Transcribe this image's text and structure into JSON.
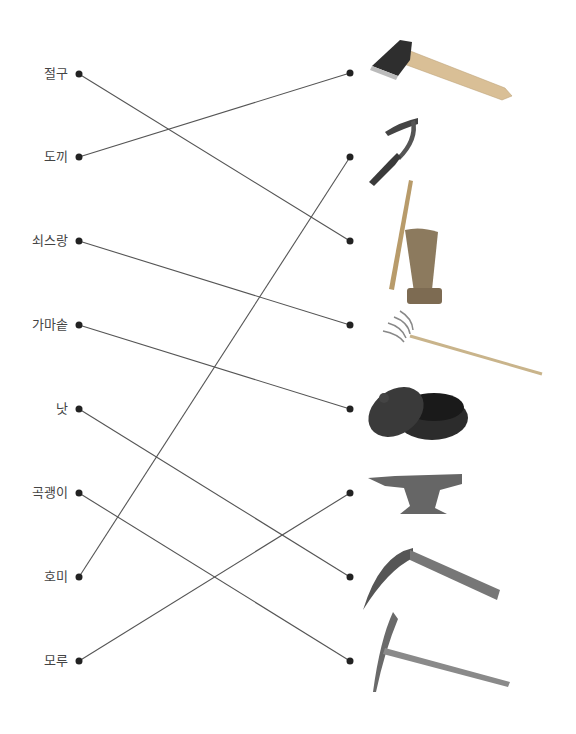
{
  "left_items": [
    {
      "label": "절구",
      "y": 74
    },
    {
      "label": "도끼",
      "y": 157
    },
    {
      "label": "쇠스랑",
      "y": 241
    },
    {
      "label": "가마솥",
      "y": 325
    },
    {
      "label": "낫",
      "y": 409
    },
    {
      "label": "곡괭이",
      "y": 493
    },
    {
      "label": "호미",
      "y": 577
    },
    {
      "label": "모루",
      "y": 661
    }
  ],
  "right_items": [
    {
      "image": "axe",
      "y": 73
    },
    {
      "image": "hoe",
      "y": 157
    },
    {
      "image": "mortar-and-pestle",
      "y": 241
    },
    {
      "image": "pitchfork",
      "y": 325
    },
    {
      "image": "iron-pot",
      "y": 409
    },
    {
      "image": "anvil",
      "y": 493
    },
    {
      "image": "sickle",
      "y": 577
    },
    {
      "image": "pickaxe",
      "y": 661
    }
  ],
  "connections": [
    {
      "from": "절구",
      "to": "mortar-and-pestle"
    },
    {
      "from": "도끼",
      "to": "axe"
    },
    {
      "from": "쇠스랑",
      "to": "pitchfork"
    },
    {
      "from": "가마솥",
      "to": "iron-pot"
    },
    {
      "from": "낫",
      "to": "sickle"
    },
    {
      "from": "곡괭이",
      "to": "pickaxe"
    },
    {
      "from": "호미",
      "to": "hoe"
    },
    {
      "from": "모루",
      "to": "anvil"
    }
  ],
  "colors": {
    "line": "#555555",
    "dot": "#222222",
    "text": "#444444"
  }
}
